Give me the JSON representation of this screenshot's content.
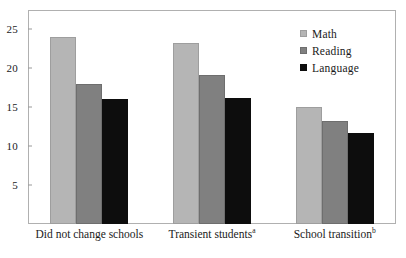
{
  "chart_data": {
    "type": "bar",
    "title": "",
    "subtitle": "",
    "xlabel": "",
    "ylabel": "",
    "ylim": [
      0,
      27.5
    ],
    "yticks": [
      5,
      10,
      15,
      20,
      25
    ],
    "ytick_labels": [
      "5",
      "10",
      "15",
      "20",
      "25"
    ],
    "grid": false,
    "legend_position": "top-right",
    "categories": [
      "Did not change schools",
      "Transient students",
      "School transition"
    ],
    "category_superscripts": [
      "",
      "a",
      "b"
    ],
    "series": [
      {
        "name": "Math",
        "color": "#b5b5b5",
        "values": [
          24.0,
          23.2,
          15.1
        ]
      },
      {
        "name": "Reading",
        "color": "#808080",
        "values": [
          18.0,
          19.2,
          13.2
        ]
      },
      {
        "name": "Language",
        "color": "#0d0d0d",
        "values": [
          16.1,
          16.2,
          11.7
        ]
      }
    ]
  },
  "legend": {
    "items": [
      {
        "label": "Math",
        "swatch": "math-swatch"
      },
      {
        "label": "Reading",
        "swatch": "reading-swatch"
      },
      {
        "label": "Language",
        "swatch": "language-swatch"
      }
    ]
  },
  "axis": {
    "y": {
      "ticks": [
        "5",
        "10",
        "15",
        "20",
        "25"
      ]
    },
    "x": {
      "labels": [
        {
          "text": "Did not change schools",
          "sup": ""
        },
        {
          "text": "Transient students",
          "sup": "a"
        },
        {
          "text": "School transition",
          "sup": "b"
        }
      ]
    }
  },
  "colors": {
    "math": "#b5b5b5",
    "reading": "#808080",
    "language": "#0d0d0d",
    "frame": "#b0b0b0",
    "text": "#1a1a1a",
    "background": "#ffffff"
  }
}
